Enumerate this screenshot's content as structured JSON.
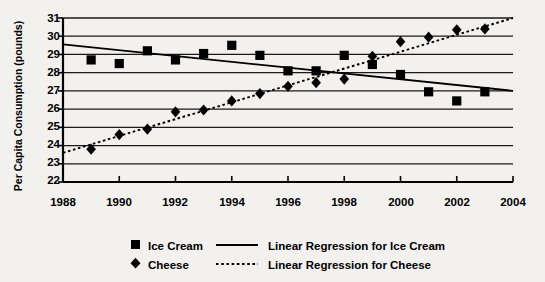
{
  "chart_data": {
    "type": "scatter",
    "title": "",
    "xlabel": "",
    "ylabel": "Per Capita Consumption (pounds)",
    "xlim": [
      1988,
      2004
    ],
    "ylim": [
      22,
      31
    ],
    "xticks": [
      1988,
      1990,
      1992,
      1994,
      1996,
      1998,
      2000,
      2002,
      2004
    ],
    "yticks": [
      22,
      23,
      24,
      25,
      26,
      27,
      28,
      29,
      30,
      31
    ],
    "grid": "horizontal",
    "legend_position": "bottom",
    "x": [
      1989,
      1990,
      1991,
      1992,
      1993,
      1994,
      1995,
      1996,
      1997,
      1998,
      1999,
      2000,
      2001,
      2002,
      2003
    ],
    "series": [
      {
        "name": "Ice Cream",
        "marker": "square",
        "color": "#000000",
        "values": [
          28.7,
          28.5,
          29.2,
          28.7,
          29.05,
          29.5,
          28.95,
          28.1,
          28.1,
          28.95,
          28.45,
          27.9,
          26.95,
          26.45,
          26.95
        ]
      },
      {
        "name": "Cheese",
        "marker": "diamond",
        "color": "#000000",
        "values": [
          23.8,
          24.6,
          24.9,
          25.85,
          25.95,
          26.45,
          26.85,
          27.25,
          27.45,
          27.65,
          28.9,
          29.7,
          29.95,
          30.35,
          30.4
        ]
      }
    ],
    "trendlines": [
      {
        "name": "Linear Regression for Ice Cream",
        "style": "solid",
        "color": "#000000",
        "x_start": 1988,
        "y_start": 29.55,
        "x_end": 2004,
        "y_end": 27.0
      },
      {
        "name": "Linear Regression for Cheese",
        "style": "dotted",
        "color": "#000000",
        "x_start": 1988,
        "y_start": 23.6,
        "x_end": 2004,
        "y_end": 31.0
      }
    ],
    "legend": [
      {
        "label": "Ice Cream",
        "marker": "square",
        "kind": "marker"
      },
      {
        "label": "Linear Regression for Ice Cream",
        "marker": "solid-line",
        "kind": "line"
      },
      {
        "label": "Cheese",
        "marker": "diamond",
        "kind": "marker"
      },
      {
        "label": "Linear Regression for Cheese",
        "marker": "dotted-line",
        "kind": "line"
      }
    ]
  },
  "axes": {
    "y_title": "Per Capita Consumption (pounds)",
    "y_tick_labels": [
      "31",
      "30",
      "29",
      "28",
      "27",
      "26",
      "25",
      "24",
      "23",
      "22"
    ],
    "x_tick_labels": [
      "1988",
      "1990",
      "1992",
      "1994",
      "1996",
      "1998",
      "2000",
      "2002",
      "2004"
    ]
  },
  "legend": {
    "ice_cream": "Ice Cream",
    "cheese": "Cheese",
    "reg_ice_cream": "Linear Regression for Ice Cream",
    "reg_cheese": "Linear Regression for Cheese"
  },
  "colors": {
    "background": "#f2f1ee",
    "ink": "#000000",
    "gridline": "#1a1a1a"
  }
}
